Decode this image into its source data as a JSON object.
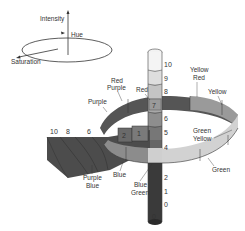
{
  "legend": {
    "intensity_label": "Intensity",
    "hue_label": "Hue",
    "saturation_label": "Saturation"
  },
  "hue_labels": {
    "red": "Red",
    "red_purple_1": "Red",
    "red_purple_2": "Purple",
    "purple": "Purple",
    "yellow_red_1": "Yellow",
    "yellow_red_2": "Red",
    "yellow": "Yellow",
    "green_yellow_1": "Green",
    "green_yellow_2": "Yellow",
    "green": "Green",
    "blue_green_1": "Blue",
    "blue_green_2": "Green",
    "blue": "Blue",
    "purple_blue_1": "Purple",
    "purple_blue_2": "Blue"
  },
  "intensity_scale": {
    "v10": "10",
    "v9": "9",
    "v8": "8",
    "v7": "7",
    "v6": "6",
    "v5": "5",
    "v4": "4",
    "v2": "2",
    "v1": "1",
    "v0": "0",
    "bottom": "0"
  },
  "saturation_scale": {
    "s10": "10",
    "s8": "8",
    "s6": "6",
    "block_a": "2",
    "block_b": "1"
  },
  "colors": {
    "dark": "#4a4a4a",
    "mid": "#8a8a8a",
    "light": "#c8c8c8",
    "lighter": "#dcdcdc",
    "line": "#333333"
  }
}
